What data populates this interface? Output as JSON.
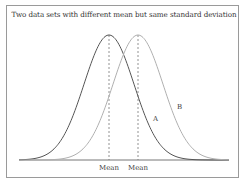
{
  "chart_data": {
    "type": "line",
    "title": "Two data sets with different mean but same standard deviation",
    "xlabel": "",
    "ylabel": "",
    "grid": false,
    "legend": "none",
    "series": [
      {
        "name": "A",
        "mean": 109,
        "sd": 25,
        "color": "#555555",
        "label": "A",
        "label_pos": [
          153,
          121
        ]
      },
      {
        "name": "B",
        "mean": 138,
        "sd": 25,
        "color": "#b0b0b0",
        "label": "B",
        "label_pos": [
          177,
          109
        ]
      }
    ],
    "annotations": [
      {
        "text": "Mean",
        "x": 109,
        "line": "dashed",
        "series": "A"
      },
      {
        "text": "Mean",
        "x": 138,
        "line": "dashed",
        "series": "B"
      }
    ],
    "axis": {
      "x_start": 19,
      "x_end": 229,
      "baseline_y": 160,
      "peak_y": 35
    }
  }
}
